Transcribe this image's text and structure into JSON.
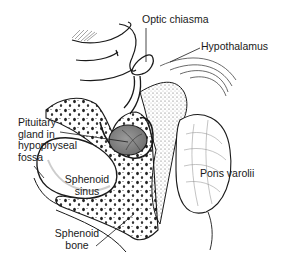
{
  "diagram": {
    "type": "anatomical-illustration",
    "labels": {
      "optic_chiasma": "Optic chiasma",
      "hypothalamus": "Hypothalamus",
      "pituitary_line1": "Pituitary",
      "pituitary_line2": "gland in",
      "pituitary_line3": "hypophyseal",
      "pituitary_line4": "fossa",
      "sphenoid_sinus_line1": "Sphenoid",
      "sphenoid_sinus_line2": "sinus",
      "pons": "Pons varolii",
      "sphenoid_bone_line1": "Sphenoid",
      "sphenoid_bone_line2": "bone"
    },
    "colors": {
      "ink": "#1a1a1a",
      "gland_fill": "#8a8a8a",
      "stipple": "#b5b5b5",
      "background": "#ffffff"
    }
  }
}
